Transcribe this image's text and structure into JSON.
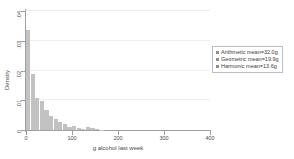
{
  "chart_data": {
    "type": "bar",
    "title": "",
    "subtitle": "",
    "xlabel": "g alcohol last week",
    "ylabel": "Density",
    "xlim": [
      0,
      400
    ],
    "ylim": [
      0,
      0.04
    ],
    "grid": true,
    "bin_width": 10,
    "x_ticks": [
      "0",
      "100",
      "200",
      "300",
      "400"
    ],
    "x_tick_values": [
      0,
      100,
      200,
      300,
      400
    ],
    "y_ticks": [
      "0",
      ".01",
      ".02",
      ".03",
      ".04"
    ],
    "y_tick_values": [
      0,
      0.01,
      0.02,
      0.03,
      0.04
    ],
    "bin_starts": [
      0,
      10,
      20,
      30,
      40,
      50,
      60,
      70,
      80,
      90,
      100,
      110,
      120,
      130,
      140,
      150,
      160
    ],
    "values": [
      0.0335,
      0.0188,
      0.0108,
      0.0097,
      0.0066,
      0.0047,
      0.0038,
      0.0027,
      0.0019,
      0.0009,
      0.0013,
      0.0007,
      0.0004,
      0.0009,
      0.0007,
      0.0003,
      0.0001
    ],
    "bar_color": "#c2c2c2",
    "legend_position": "right",
    "legend": [
      "Arithmetic mean=32.0g",
      "Geometric mean=19.9g",
      "Harmonic mean=13.6g"
    ],
    "annotations": []
  },
  "legend": {
    "items": [
      {
        "label": "Arithmetic mean=32.0g"
      },
      {
        "label": "Geometric mean=19.9g"
      },
      {
        "label": "Harmonic mean=13.6g"
      }
    ]
  },
  "axes": {
    "x_title": "g alcohol last week",
    "y_title": "Density"
  }
}
